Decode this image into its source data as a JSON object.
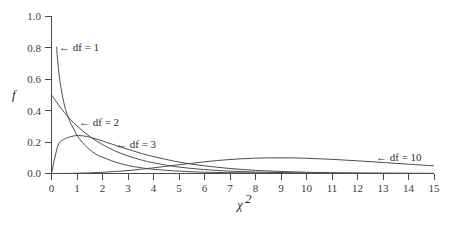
{
  "chart_data": {
    "type": "line",
    "title": "",
    "subtitle": "",
    "xlabel": "χ²",
    "ylabel": "f",
    "xlim": [
      0,
      15
    ],
    "ylim": [
      0.0,
      1.0
    ],
    "grid": false,
    "legend_position": "inline-annotations",
    "x_ticks": [
      "0",
      "1",
      "2",
      "3",
      "4",
      "5",
      "6",
      "7",
      "8",
      "9",
      "10",
      "11",
      "12",
      "13",
      "14",
      "15"
    ],
    "x_tick_values": [
      0,
      1,
      2,
      3,
      4,
      5,
      6,
      7,
      8,
      9,
      10,
      11,
      12,
      13,
      14,
      15
    ],
    "y_ticks": [
      "0.0",
      "0.2",
      "0.4",
      "0.6",
      "0.8",
      "1.0"
    ],
    "y_tick_values": [
      0.0,
      0.2,
      0.4,
      0.6,
      0.8,
      1.0
    ],
    "series": [
      {
        "name": "df = 1",
        "df": 1,
        "x": [
          0.2,
          0.25,
          0.3,
          0.35,
          0.4,
          0.5,
          0.6,
          0.7,
          0.8,
          0.9,
          1.0,
          1.2,
          1.4,
          1.6,
          1.8,
          2.0,
          2.5,
          3.0,
          3.5,
          4.0,
          5.0,
          6.0,
          7.0,
          8.0,
          9.0,
          10.0,
          12.0,
          15.0
        ],
        "values": [
          0.807,
          0.704,
          0.628,
          0.569,
          0.521,
          0.439,
          0.383,
          0.339,
          0.304,
          0.275,
          0.242,
          0.2,
          0.166,
          0.139,
          0.117,
          0.104,
          0.073,
          0.051,
          0.037,
          0.027,
          0.015,
          0.008,
          0.005,
          0.003,
          0.002,
          0.001,
          0.0005,
          0.0002
        ]
      },
      {
        "name": "df = 2",
        "df": 2,
        "x": [
          0,
          0.5,
          1.0,
          1.5,
          2.0,
          2.5,
          3.0,
          3.5,
          4.0,
          5.0,
          6.0,
          7.0,
          8.0,
          9.0,
          10.0,
          11.0,
          12.0,
          13.0,
          14.0,
          15.0
        ],
        "values": [
          0.5,
          0.389,
          0.303,
          0.236,
          0.184,
          0.143,
          0.112,
          0.087,
          0.068,
          0.041,
          0.025,
          0.015,
          0.009,
          0.006,
          0.003,
          0.002,
          0.001,
          0.0008,
          0.0005,
          0.0003
        ]
      },
      {
        "name": "df = 3",
        "df": 3,
        "x": [
          0,
          0.25,
          0.5,
          0.75,
          1.0,
          1.25,
          1.5,
          2.0,
          2.5,
          3.0,
          3.5,
          4.0,
          5.0,
          6.0,
          7.0,
          8.0,
          9.0,
          10.0,
          11.0,
          12.0,
          13.0,
          14.0,
          15.0
        ],
        "values": [
          0.0,
          0.176,
          0.219,
          0.234,
          0.242,
          0.239,
          0.232,
          0.207,
          0.18,
          0.154,
          0.129,
          0.108,
          0.073,
          0.049,
          0.032,
          0.02,
          0.013,
          0.008,
          0.005,
          0.003,
          0.002,
          0.001,
          0.0008
        ]
      },
      {
        "name": "df = 10",
        "df": 10,
        "x": [
          0,
          1.0,
          2.0,
          3.0,
          4.0,
          5.0,
          6.0,
          7.0,
          8.0,
          9.0,
          10.0,
          11.0,
          12.0,
          13.0,
          14.0,
          15.0
        ],
        "values": [
          0.0,
          0.0016,
          0.0077,
          0.0188,
          0.0361,
          0.0558,
          0.0746,
          0.0892,
          0.0977,
          0.1,
          0.097,
          0.0902,
          0.0808,
          0.0701,
          0.0592,
          0.0488
        ]
      }
    ],
    "annotations": [
      {
        "id": "df1",
        "text": "← df = 1",
        "x": 0.35,
        "y": 0.8
      },
      {
        "id": "df2",
        "text": "← df = 2",
        "x": 1.1,
        "y": 0.335
      },
      {
        "id": "df3",
        "text": "← df = 3",
        "x": 2.55,
        "y": 0.19
      },
      {
        "id": "df10",
        "text": "← df = 10",
        "x": 12.9,
        "y": 0.095
      }
    ]
  },
  "labels": {
    "y_axis_title": "f",
    "x_axis_title_base": "χ",
    "x_axis_title_sup": "2",
    "annot_df1": "← df = 1",
    "annot_df2": "← df = 2",
    "annot_df3": "← df = 3",
    "annot_df10": "← df = 10"
  },
  "colors": {
    "background": "#ffffff",
    "curve": "#4d4d4d",
    "axis": "#4a4a4a",
    "text": "#2e2e2e"
  }
}
